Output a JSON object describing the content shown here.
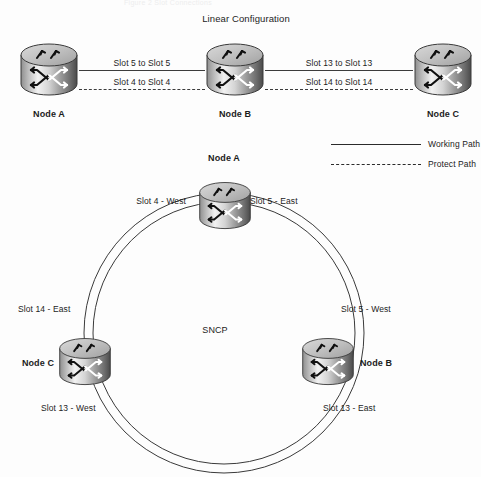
{
  "page": {
    "cut_off_caption": "Figure 2  Slot Connections",
    "background_color": "#fdfdfd",
    "line_color": "#3c3c3c",
    "text_color": "#1c1c1c"
  },
  "linear": {
    "title": "Linear Configuration",
    "nodes": [
      {
        "label": "Node A",
        "icon": "router-cylinder-icon"
      },
      {
        "label": "Node B",
        "icon": "router-cylinder-icon"
      },
      {
        "label": "Node C",
        "icon": "router-cylinder-icon"
      }
    ],
    "links": [
      {
        "working_label": "Slot 5 to Slot 5",
        "protect_label": "Slot 4 to Slot 4"
      },
      {
        "working_label": "Slot 13 to Slot 13",
        "protect_label": "Slot 14 to Slot 14"
      }
    ]
  },
  "legend": {
    "items": [
      {
        "label": "Working Path",
        "style": "solid",
        "icon": "solid-line-icon"
      },
      {
        "label": "Protect Path",
        "style": "dashed",
        "icon": "dashed-line-icon"
      }
    ]
  },
  "ring": {
    "center_label": "SNCP",
    "nodes": [
      {
        "label": "Node A",
        "position": "top",
        "icon": "router-cylinder-icon",
        "ports": [
          {
            "label": "Slot 4 - West",
            "side": "left"
          },
          {
            "label": "Slot 5 - East",
            "side": "right"
          }
        ]
      },
      {
        "label": "Node B",
        "position": "bottom-right",
        "icon": "router-cylinder-icon",
        "ports": [
          {
            "label": "Slot 5 - West",
            "side": "upper-right"
          },
          {
            "label": "Slot 13 - East",
            "side": "lower-right"
          }
        ]
      },
      {
        "label": "Node C",
        "position": "bottom-left",
        "icon": "router-cylinder-icon",
        "ports": [
          {
            "label": "Slot 14 - East",
            "side": "upper-left"
          },
          {
            "label": "Slot 13 - West",
            "side": "lower-left"
          }
        ]
      }
    ]
  }
}
